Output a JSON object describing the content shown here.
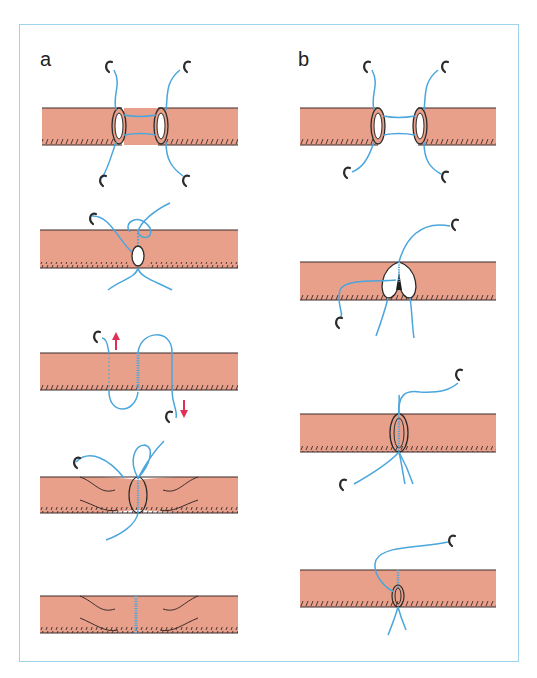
{
  "figure": {
    "panels": [
      {
        "label": "a",
        "steps": 5,
        "description": "Anastomosis sequence with stay sutures, twisted vessel ends"
      },
      {
        "label": "b",
        "steps": 4,
        "description": "Anastomosis sequence with continuous suture"
      }
    ],
    "colors": {
      "tissue": "#e8a08a",
      "tissue_edge": "#3a2a2a",
      "thread": "#4aa6dc",
      "arrow": "#e0305a",
      "frame": "#9fd3ec",
      "needle": "#2b2b2b"
    }
  }
}
